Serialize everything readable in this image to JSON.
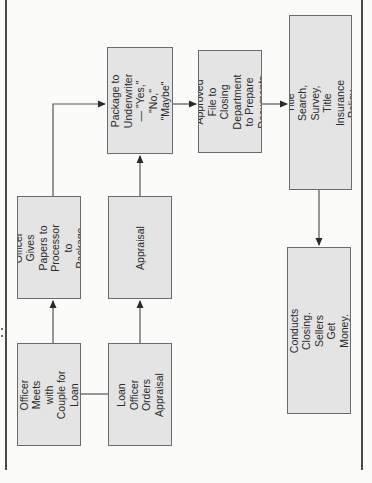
{
  "diagram": {
    "type": "flowchart",
    "orientation": "rotated-90-ccw",
    "colors": {
      "box_fill": "#e4e4e4",
      "box_border": "#6b6b6b",
      "line": "#555555",
      "background": "#fbfbfa"
    },
    "nodes": [
      {
        "id": "meet",
        "label": "Loan Officer Meets\nwith Couple for\nLoan Application"
      },
      {
        "id": "order_appraisal",
        "label": "Loan Officer\nOrders Appraisal"
      },
      {
        "id": "give_papers",
        "label": "Loan Officer Gives\nPapers to Processor\nto Package File"
      },
      {
        "id": "appraisal",
        "label": "Appraisal"
      },
      {
        "id": "underwriter",
        "label": "Package to\nUnderwriter — \"Yes,\"\n\"No,\" \"Maybe\""
      },
      {
        "id": "closing_dept",
        "label": "Approved File to\nClosing Department\nto Prepare\nDocuments"
      },
      {
        "id": "settlement_agent",
        "label": "Sends to Settlement Agent Who\nOrders Title Search, Survey, Title\nInsurance Policy, and Prepares\nDeed and HUD-1 Statement"
      },
      {
        "id": "closing",
        "label": "Settlement or Closing Agent\nConducts Closing. Sellers Get\nMoney. Buyers Get Keys\nand Deed."
      }
    ],
    "edges": [
      {
        "from": "meet",
        "to": "order_appraisal",
        "arrow": false
      },
      {
        "from": "meet",
        "to": "give_papers",
        "arrow": true
      },
      {
        "from": "order_appraisal",
        "to": "appraisal",
        "arrow": true
      },
      {
        "from": "give_papers",
        "to": "underwriter",
        "arrow": true
      },
      {
        "from": "appraisal",
        "to": "underwriter",
        "arrow": true
      },
      {
        "from": "underwriter",
        "to": "closing_dept",
        "arrow": true
      },
      {
        "from": "closing_dept",
        "to": "settlement_agent",
        "arrow": true
      },
      {
        "from": "settlement_agent",
        "to": "closing",
        "arrow": true
      }
    ]
  }
}
